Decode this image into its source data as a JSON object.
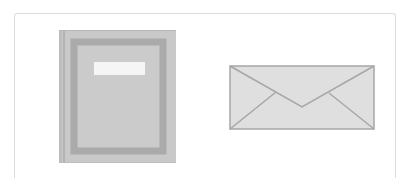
{
  "canvas": {
    "width": 408,
    "height": 178,
    "background": "#ffffff"
  },
  "card": {
    "border_color": "#dcdcdc"
  },
  "icons": [
    {
      "name": "book-icon",
      "colors": {
        "cover": "#c8c8c8",
        "spine": "#b9b9b9",
        "frame": "#a9a9a9",
        "label": "#f4f4f4",
        "edge": "#bdbdbd"
      }
    },
    {
      "name": "envelope-icon",
      "colors": {
        "fill": "#dedede",
        "stroke": "#a6a6a6"
      }
    }
  ]
}
